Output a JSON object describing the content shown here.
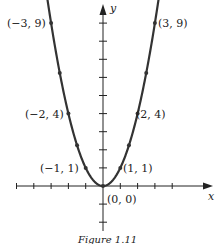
{
  "figure": {
    "caption": "Figure 1.11",
    "colors": {
      "curve": "#333333",
      "axis": "#222222",
      "background": "#ffffff"
    }
  },
  "chart_data": {
    "type": "line",
    "title": "",
    "function": "y = x^2",
    "xlabel": "x",
    "ylabel": "y",
    "xlim": [
      -5,
      6
    ],
    "ylim": [
      -2.5,
      10
    ],
    "grid": false,
    "legend": null,
    "x_ticks": [
      -5,
      -4,
      -3,
      -2,
      -1,
      1,
      2,
      3,
      4
    ],
    "y_ticks": [
      -2,
      -1,
      1,
      2,
      3,
      4,
      5,
      6,
      7,
      8,
      9
    ],
    "series": [
      {
        "name": "y = x^2",
        "x": [
          -3,
          -2.5,
          -2,
          -1.5,
          -1,
          0,
          1,
          1.5,
          2,
          2.5,
          3
        ],
        "y": [
          9,
          6.25,
          4,
          2.25,
          1,
          0,
          1,
          2.25,
          4,
          6.25,
          9
        ]
      }
    ],
    "annotations": [
      {
        "text": "(−3, 9)",
        "x": -3,
        "y": 9
      },
      {
        "text": "(3, 9)",
        "x": 3,
        "y": 9
      },
      {
        "text": "(−2, 4)",
        "x": -2,
        "y": 4
      },
      {
        "text": "(2, 4)",
        "x": 2,
        "y": 4
      },
      {
        "text": "(−1, 1)",
        "x": -1,
        "y": 1
      },
      {
        "text": "(1, 1)",
        "x": 1,
        "y": 1
      },
      {
        "text": "(0, 0)",
        "x": 0,
        "y": 0
      }
    ]
  }
}
